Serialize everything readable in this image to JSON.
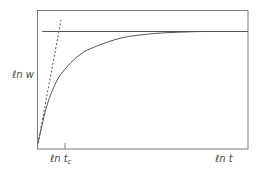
{
  "chart_data": {
    "type": "line",
    "title": "",
    "xlabel": "ℓn t",
    "ylabel": "ℓn w",
    "x_tick_labels": [
      {
        "main": "ℓn t",
        "sub": "c",
        "position": 0.12
      }
    ],
    "grid": false,
    "legend": "none",
    "xlim": [
      0,
      1
    ],
    "ylim": [
      0,
      1
    ],
    "series": [
      {
        "name": "growth-curve",
        "style": "solid",
        "description": "saturating curve rising from origin to plateau",
        "x": [
          0,
          0.04,
          0.08,
          0.12,
          0.2,
          0.28,
          0.4,
          0.55,
          0.7,
          0.8,
          1.0
        ],
        "y": [
          0.04,
          0.3,
          0.46,
          0.56,
          0.68,
          0.74,
          0.8,
          0.83,
          0.842,
          0.845,
          0.845
        ]
      },
      {
        "name": "initial-slope-tangent",
        "style": "dashed",
        "description": "initial tangent line",
        "x": [
          0,
          0.11
        ],
        "y": [
          0.04,
          0.93
        ]
      },
      {
        "name": "plateau-asymptote",
        "style": "solid",
        "description": "horizontal asymptote",
        "x": [
          0.02,
          0.99
        ],
        "y": [
          0.845,
          0.845
        ]
      }
    ]
  },
  "colors": {
    "axis": "#7a7a7a",
    "curve": "#555555",
    "label": "#4a4a4a"
  }
}
